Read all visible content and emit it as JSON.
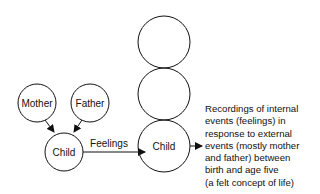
{
  "diagram": {
    "nodes": {
      "mother": "Mother",
      "father": "Father",
      "child_small": "Child",
      "child_large": "Child"
    },
    "edge_label": "Feelings",
    "stack_circles": 3,
    "description_lines": [
      "Recordings of internal",
      "events (feelings) in",
      "response to external",
      "events (mostly mother",
      "and father) between",
      "birth and age five",
      "(a felt concept of life)"
    ]
  }
}
